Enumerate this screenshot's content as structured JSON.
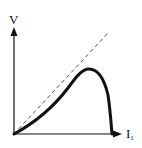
{
  "diagram": {
    "y_axis_label": "V",
    "x_axis_label": "I",
    "x_axis_subscript": "1",
    "reference_line": "dashed diagonal from origin",
    "curve": "rises from origin below the diagonal, peaks, then falls sharply to the x-axis",
    "colors": {
      "stroke": "#111111",
      "dashed": "#555555",
      "background": "#ffffff"
    }
  }
}
